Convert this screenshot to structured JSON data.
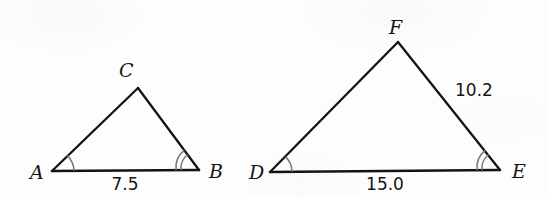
{
  "figure": {
    "background_color": "#fdfdfd",
    "stroke_color": "#131313",
    "arc_color": "#777777",
    "triangles": [
      {
        "name": "triangle-abc",
        "vertices": [
          {
            "label": "A",
            "label_x": 30,
            "label_y": 179,
            "x": 52,
            "y": 171,
            "arcs": 1
          },
          {
            "label": "C",
            "label_x": 119,
            "label_y": 77,
            "x": 138,
            "y": 88,
            "arcs": 0
          },
          {
            "label": "B",
            "label_x": 209,
            "label_y": 178,
            "x": 199,
            "y": 170,
            "arcs": 2
          }
        ],
        "side_labels": [
          {
            "text": "7.5",
            "x": 125,
            "y": 190,
            "anchor": "middle",
            "side": "AB"
          }
        ]
      },
      {
        "name": "triangle-def",
        "vertices": [
          {
            "label": "D",
            "label_x": 249,
            "label_y": 179,
            "x": 270,
            "y": 172,
            "arcs": 1
          },
          {
            "label": "F",
            "label_x": 389,
            "label_y": 34,
            "x": 398,
            "y": 42,
            "arcs": 0
          },
          {
            "label": "E",
            "label_x": 512,
            "label_y": 178,
            "x": 500,
            "y": 170,
            "arcs": 2
          }
        ],
        "side_labels": [
          {
            "text": "15.0",
            "x": 385,
            "y": 190,
            "anchor": "middle",
            "side": "DE"
          },
          {
            "text": "10.2",
            "x": 455,
            "y": 96,
            "anchor": "start",
            "side": "FE"
          }
        ]
      }
    ],
    "measurements": [
      {
        "label": "7.5",
        "segment": "AB"
      },
      {
        "label": "15.0",
        "segment": "DE"
      },
      {
        "label": "10.2",
        "segment": "FE"
      }
    ],
    "vertex_labels": [
      "A",
      "C",
      "B",
      "D",
      "F",
      "E"
    ]
  }
}
